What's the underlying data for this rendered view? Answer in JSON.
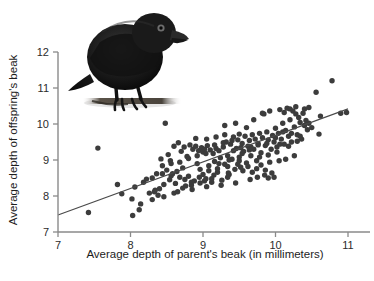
{
  "chart_data": {
    "type": "scatter",
    "title": "",
    "xlabel": "Average depth of parent's beak (in millimeters)",
    "ylabel": "Average depth of offspring's beak",
    "xlim": [
      7,
      11
    ],
    "ylim": [
      7,
      12
    ],
    "xticks": [
      7,
      8,
      9,
      10,
      11
    ],
    "yticks": [
      7,
      8,
      9,
      10,
      11,
      12
    ],
    "xtick_labels": [
      "7",
      "8",
      "9",
      "10",
      "11"
    ],
    "ytick_labels": [
      "7",
      "8",
      "9",
      "10",
      "11",
      "12"
    ],
    "grid": false,
    "legend": null,
    "point_color": "#3c3c3c",
    "line_color": "#4a4a4a",
    "axis_color": "#8a8a8a",
    "background": "#ffffff",
    "trendline": {
      "type": "linear",
      "x_start": 7.0,
      "y_start": 7.47,
      "x_end": 11.0,
      "y_end": 10.42,
      "slope": 0.7375,
      "intercept": 2.3075
    },
    "annotations": [
      {
        "kind": "image",
        "name": "darwin-finch-photo",
        "description": "Black Darwin's finch perched on a branch"
      }
    ],
    "series": [
      {
        "name": "parent-offspring beak depth",
        "points": [
          [
            7.42,
            7.54
          ],
          [
            7.55,
            9.33
          ],
          [
            7.82,
            8.32
          ],
          [
            7.88,
            8.06
          ],
          [
            8.02,
            7.92
          ],
          [
            8.03,
            7.46
          ],
          [
            8.06,
            8.25
          ],
          [
            8.12,
            7.62
          ],
          [
            8.14,
            7.78
          ],
          [
            8.18,
            8.38
          ],
          [
            8.22,
            8.47
          ],
          [
            8.26,
            8.08
          ],
          [
            8.3,
            7.9
          ],
          [
            8.33,
            8.12
          ],
          [
            8.34,
            8.16
          ],
          [
            8.36,
            8.62
          ],
          [
            8.4,
            8.2
          ],
          [
            8.42,
            9.03
          ],
          [
            8.44,
            8.84
          ],
          [
            8.46,
            8.32
          ],
          [
            8.48,
            10.02
          ],
          [
            8.5,
            8.72
          ],
          [
            8.52,
            9.15
          ],
          [
            8.54,
            8.45
          ],
          [
            8.56,
            8.9
          ],
          [
            8.58,
            8.62
          ],
          [
            8.6,
            9.38
          ],
          [
            8.62,
            8.35
          ],
          [
            8.64,
            8.68
          ],
          [
            8.66,
            9.48
          ],
          [
            8.68,
            8.52
          ],
          [
            8.7,
            9.24
          ],
          [
            8.72,
            8.78
          ],
          [
            8.74,
            9.36
          ],
          [
            8.76,
            8.28
          ],
          [
            8.78,
            9.1
          ],
          [
            8.8,
            8.55
          ],
          [
            8.82,
            9.42
          ],
          [
            8.84,
            8.3
          ],
          [
            8.86,
            9.3
          ],
          [
            8.88,
            8.42
          ],
          [
            8.9,
            9.38
          ],
          [
            8.92,
            8.9
          ],
          [
            8.94,
            9.26
          ],
          [
            8.96,
            8.36
          ],
          [
            8.98,
            9.34
          ],
          [
            9.0,
            8.6
          ],
          [
            9.0,
            9.22
          ],
          [
            9.02,
            9.3
          ],
          [
            9.04,
            8.48
          ],
          [
            9.06,
            9.4
          ],
          [
            9.08,
            8.84
          ],
          [
            9.1,
            9.28
          ],
          [
            9.12,
            8.38
          ],
          [
            9.14,
            9.18
          ],
          [
            9.16,
            8.96
          ],
          [
            9.18,
            9.32
          ],
          [
            9.2,
            8.66
          ],
          [
            9.22,
            9.26
          ],
          [
            9.24,
            9.06
          ],
          [
            9.26,
            8.44
          ],
          [
            9.28,
            9.36
          ],
          [
            9.3,
            8.88
          ],
          [
            9.32,
            9.5
          ],
          [
            9.34,
            9.12
          ],
          [
            9.36,
            8.6
          ],
          [
            9.38,
            9.44
          ],
          [
            9.4,
            9.02
          ],
          [
            9.42,
            9.64
          ],
          [
            9.44,
            8.74
          ],
          [
            9.46,
            9.32
          ],
          [
            9.48,
            9.56
          ],
          [
            9.5,
            9.08
          ],
          [
            9.5,
            9.72
          ],
          [
            9.52,
            8.8
          ],
          [
            9.54,
            9.46
          ],
          [
            9.56,
            9.24
          ],
          [
            9.58,
            9.66
          ],
          [
            9.6,
            8.92
          ],
          [
            9.62,
            9.38
          ],
          [
            9.64,
            9.54
          ],
          [
            9.66,
            9.12
          ],
          [
            9.68,
            9.7
          ],
          [
            9.7,
            9.3
          ],
          [
            9.72,
            9.58
          ],
          [
            9.74,
            8.98
          ],
          [
            9.76,
            9.46
          ],
          [
            9.78,
            9.74
          ],
          [
            9.8,
            9.2
          ],
          [
            9.82,
            9.62
          ],
          [
            9.84,
            10.28
          ],
          [
            9.86,
            9.4
          ],
          [
            9.88,
            9.78
          ],
          [
            9.9,
            9.56
          ],
          [
            9.92,
            10.36
          ],
          [
            9.94,
            9.3
          ],
          [
            9.96,
            9.68
          ],
          [
            9.98,
            9.5
          ],
          [
            10.0,
            9.88
          ],
          [
            10.02,
            9.36
          ],
          [
            10.04,
            9.74
          ],
          [
            10.06,
            10.4
          ],
          [
            10.08,
            9.58
          ],
          [
            10.1,
            10.02
          ],
          [
            10.12,
            9.44
          ],
          [
            10.14,
            9.82
          ],
          [
            10.16,
            10.44
          ],
          [
            10.18,
            9.66
          ],
          [
            10.2,
            10.12
          ],
          [
            10.22,
            9.5
          ],
          [
            10.24,
            10.36
          ],
          [
            10.26,
            9.92
          ],
          [
            10.28,
            10.48
          ],
          [
            10.3,
            9.7
          ],
          [
            10.32,
            10.18
          ],
          [
            10.34,
            10.04
          ],
          [
            10.36,
            9.58
          ],
          [
            10.38,
            10.3
          ],
          [
            10.4,
            9.96
          ],
          [
            10.42,
            10.1
          ],
          [
            10.44,
            9.84
          ],
          [
            10.46,
            10.02
          ],
          [
            10.5,
            9.9
          ],
          [
            10.56,
            10.88
          ],
          [
            10.6,
            9.72
          ],
          [
            10.62,
            10.22
          ],
          [
            10.78,
            11.2
          ],
          [
            10.9,
            10.3
          ],
          [
            10.98,
            10.32
          ],
          [
            8.55,
            8.98
          ],
          [
            8.65,
            8.12
          ],
          [
            8.75,
            8.46
          ],
          [
            8.85,
            8.18
          ],
          [
            8.95,
            8.52
          ],
          [
            9.05,
            8.26
          ],
          [
            9.15,
            8.58
          ],
          [
            9.25,
            8.3
          ],
          [
            9.35,
            8.64
          ],
          [
            9.45,
            8.36
          ],
          [
            9.55,
            8.7
          ],
          [
            9.65,
            8.46
          ],
          [
            9.75,
            8.52
          ],
          [
            9.85,
            8.58
          ],
          [
            9.95,
            8.64
          ],
          [
            10.05,
            8.98
          ],
          [
            9.3,
            9.96
          ],
          [
            9.45,
            10.02
          ],
          [
            9.6,
            9.9
          ],
          [
            9.7,
            10.12
          ],
          [
            9.82,
            10.3
          ],
          [
            10.12,
            10.32
          ],
          [
            10.2,
            10.42
          ],
          [
            10.28,
            10.28
          ],
          [
            8.9,
            9.6
          ],
          [
            9.05,
            9.58
          ],
          [
            9.18,
            9.64
          ],
          [
            9.3,
            9.7
          ],
          [
            9.42,
            9.26
          ],
          [
            9.54,
            9.18
          ],
          [
            9.66,
            9.36
          ],
          [
            9.78,
            9.08
          ],
          [
            9.9,
            9.14
          ],
          [
            10.02,
            9.22
          ],
          [
            10.14,
            9.02
          ],
          [
            10.26,
            9.12
          ],
          [
            8.96,
            8.74
          ],
          [
            9.08,
            8.7
          ],
          [
            9.2,
            8.76
          ],
          [
            9.34,
            8.82
          ],
          [
            9.48,
            8.88
          ],
          [
            9.62,
            8.82
          ],
          [
            9.74,
            8.76
          ],
          [
            9.86,
            8.72
          ],
          [
            9.98,
            8.52
          ],
          [
            8.44,
            8.62
          ],
          [
            8.56,
            8.56
          ],
          [
            8.68,
            8.94
          ],
          [
            8.8,
            9.04
          ],
          [
            8.92,
            9.12
          ],
          [
            9.04,
            9.18
          ],
          [
            9.16,
            9.42
          ],
          [
            9.28,
            9.48
          ],
          [
            9.4,
            9.54
          ],
          [
            9.52,
            9.34
          ],
          [
            9.64,
            9.28
          ],
          [
            9.76,
            9.42
          ],
          [
            9.88,
            9.46
          ],
          [
            10.0,
            9.62
          ],
          [
            10.1,
            9.78
          ],
          [
            10.22,
            9.74
          ],
          [
            10.34,
            9.66
          ],
          [
            8.3,
            8.5
          ],
          [
            8.38,
            8.02
          ],
          [
            8.46,
            7.98
          ],
          [
            8.6,
            8.08
          ],
          [
            8.72,
            8.22
          ],
          [
            8.84,
            8.38
          ],
          [
            9.02,
            8.42
          ],
          [
            9.12,
            8.48
          ],
          [
            9.22,
            8.9
          ],
          [
            9.36,
            9.0
          ],
          [
            9.5,
            8.98
          ],
          [
            9.68,
            8.66
          ],
          [
            9.8,
            8.86
          ],
          [
            9.92,
            8.94
          ],
          [
            10.06,
            9.44
          ],
          [
            10.18,
            9.38
          ],
          [
            10.3,
            9.52
          ],
          [
            10.4,
            10.42
          ],
          [
            10.46,
            10.46
          ],
          [
            9.9,
            8.5
          ],
          [
            9.34,
            8.52
          ]
        ]
      }
    ]
  },
  "figure": {
    "bird_caption": "Darwin's finch"
  }
}
